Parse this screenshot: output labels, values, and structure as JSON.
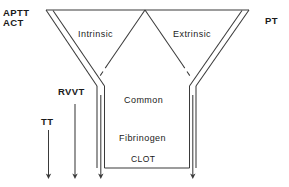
{
  "diagram": {
    "stroke_color": "#3a3a3a",
    "text_color": "#1a1a1a",
    "background_color": "#ffffff",
    "labels": {
      "aptt": "APTT",
      "act": "ACT",
      "intrinsic": "Intrinsic",
      "extrinsic": "Extrinsic",
      "pt": "PT",
      "rvvt": "RVVT",
      "tt": "TT",
      "common": "Common",
      "fibrinogen": "Fibrinogen",
      "clot": "CLOT"
    },
    "pathways": [
      {
        "name": "Intrinsic",
        "test": "APTT / ACT"
      },
      {
        "name": "Extrinsic",
        "test": "PT"
      },
      {
        "name": "Common",
        "test": "RVVT"
      },
      {
        "name": "Fibrinogen",
        "test": "TT"
      }
    ],
    "arrows": [
      {
        "name": "tt-arrow",
        "label": "TT"
      },
      {
        "name": "rvvt-arrow",
        "label": "RVVT"
      },
      {
        "name": "intrinsic-arrow",
        "label": "APTT/ACT"
      },
      {
        "name": "extrinsic-arrow",
        "label": "PT"
      }
    ]
  }
}
